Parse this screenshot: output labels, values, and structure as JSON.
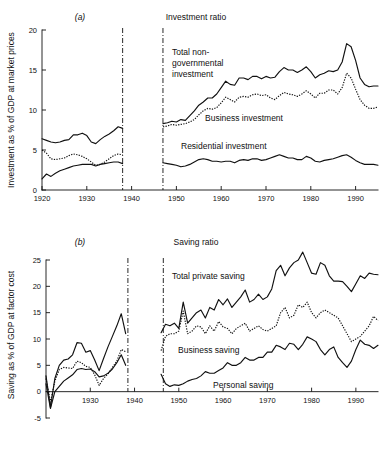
{
  "figure": {
    "background": "#ffffff",
    "ink_color": "#111111"
  },
  "panels": [
    {
      "letter": "(a)",
      "title": "Investment ratio",
      "ylabel": "Investment as % of GDP at market prices"
    },
    {
      "letter": "(b)",
      "title": "Saving ratio",
      "ylabel": "Saving as % of GDP at factor cost"
    }
  ],
  "annotations": {
    "a_total": "Total non-\ngovernmental\ninvestment",
    "a_total_line1": "Total non-",
    "a_total_line2": "governmental",
    "a_total_line3": "investment",
    "a_business": "Business investment",
    "a_residential": "Residential investment",
    "b_total": "Total private saving",
    "b_business": "Business saving",
    "b_personal": "Personal saving"
  },
  "chart_data": [
    {
      "type": "line",
      "id": "investment-ratio",
      "title": "Investment ratio",
      "panel_letter": "(a)",
      "xlabel": "",
      "ylabel": "Investment as % of GDP at market prices",
      "xlim": [
        1920,
        1995
      ],
      "ylim": [
        0,
        20
      ],
      "xticks": [
        1920,
        1930,
        1940,
        1950,
        1960,
        1970,
        1980,
        1990
      ],
      "yticks": [
        0,
        5,
        10,
        15,
        20
      ],
      "grid": false,
      "legend": "inline-annotations",
      "break_lines": [
        1938,
        1947
      ],
      "series": [
        {
          "name": "Total non-governmental investment",
          "style": "solid",
          "x": [
            1920,
            1921,
            1922,
            1923,
            1924,
            1925,
            1926,
            1927,
            1928,
            1929,
            1930,
            1931,
            1932,
            1933,
            1934,
            1935,
            1936,
            1937,
            1938
          ],
          "values": [
            6.4,
            6.2,
            6.0,
            5.9,
            6.0,
            6.2,
            6.3,
            6.9,
            6.9,
            7.1,
            6.8,
            6.0,
            5.8,
            6.3,
            6.7,
            7.0,
            7.4,
            7.9,
            7.7
          ]
        },
        {
          "name": "Total non-governmental investment",
          "style": "solid",
          "x": [
            1947,
            1948,
            1949,
            1950,
            1951,
            1952,
            1953,
            1954,
            1955,
            1956,
            1957,
            1958,
            1959,
            1960,
            1961,
            1962,
            1963,
            1964,
            1965,
            1966,
            1967,
            1968,
            1969,
            1970,
            1971,
            1972,
            1973,
            1974,
            1975,
            1976,
            1977,
            1978,
            1979,
            1980,
            1981,
            1982,
            1983,
            1984,
            1985,
            1986,
            1987,
            1988,
            1989,
            1990,
            1991,
            1992,
            1993,
            1994,
            1995
          ],
          "values": [
            8.3,
            8.4,
            8.6,
            8.5,
            8.8,
            8.7,
            9.3,
            9.9,
            10.6,
            11.0,
            11.5,
            11.5,
            12.0,
            12.8,
            13.6,
            13.2,
            13.1,
            14.0,
            14.0,
            13.8,
            14.2,
            14.2,
            13.9,
            14.2,
            14.0,
            14.1,
            14.8,
            15.3,
            15.0,
            15.0,
            14.7,
            15.0,
            15.4,
            14.8,
            14.0,
            14.4,
            14.6,
            14.9,
            14.8,
            15.0,
            16.0,
            18.3,
            17.9,
            16.2,
            14.0,
            13.2,
            12.9,
            13.0,
            13.0
          ]
        },
        {
          "name": "Business investment",
          "style": "dotted",
          "x": [
            1920,
            1921,
            1922,
            1923,
            1924,
            1925,
            1926,
            1927,
            1928,
            1929,
            1930,
            1931,
            1932,
            1933,
            1934,
            1935,
            1936,
            1937,
            1938
          ],
          "values": [
            5.0,
            4.6,
            3.9,
            3.8,
            3.9,
            4.0,
            4.3,
            4.5,
            4.4,
            4.2,
            3.9,
            3.5,
            3.1,
            3.2,
            3.5,
            3.9,
            4.3,
            4.5,
            4.4
          ]
        },
        {
          "name": "Business investment",
          "style": "dotted",
          "x": [
            1947,
            1948,
            1949,
            1950,
            1951,
            1952,
            1953,
            1954,
            1955,
            1956,
            1957,
            1958,
            1959,
            1960,
            1961,
            1962,
            1963,
            1964,
            1965,
            1966,
            1967,
            1968,
            1969,
            1970,
            1971,
            1972,
            1973,
            1974,
            1975,
            1976,
            1977,
            1978,
            1979,
            1980,
            1981,
            1982,
            1983,
            1984,
            1985,
            1986,
            1987,
            1988,
            1989,
            1990,
            1991,
            1992,
            1993,
            1994,
            1995
          ],
          "values": [
            7.9,
            8.0,
            8.2,
            8.1,
            8.2,
            8.3,
            8.5,
            8.8,
            9.4,
            9.9,
            10.2,
            10.1,
            10.3,
            10.9,
            11.6,
            11.3,
            11.0,
            11.6,
            11.7,
            11.6,
            11.9,
            12.0,
            11.8,
            11.9,
            11.5,
            11.3,
            11.8,
            12.2,
            12.0,
            11.9,
            11.7,
            12.0,
            12.4,
            12.0,
            11.5,
            12.1,
            12.1,
            12.5,
            12.5,
            12.0,
            12.8,
            14.6,
            14.0,
            12.6,
            11.3,
            10.6,
            10.2,
            10.2,
            10.4
          ]
        },
        {
          "name": "Residential investment",
          "style": "solid",
          "x": [
            1920,
            1921,
            1922,
            1923,
            1924,
            1925,
            1926,
            1927,
            1928,
            1929,
            1930,
            1931,
            1932,
            1933,
            1934,
            1935,
            1936,
            1937,
            1938
          ],
          "values": [
            1.4,
            2.0,
            1.7,
            2.1,
            2.4,
            2.6,
            2.8,
            3.0,
            3.1,
            3.2,
            3.2,
            3.2,
            3.0,
            3.2,
            3.3,
            3.4,
            3.5,
            3.5,
            3.3
          ]
        },
        {
          "name": "Residential investment",
          "style": "solid",
          "x": [
            1947,
            1948,
            1949,
            1950,
            1951,
            1952,
            1953,
            1954,
            1955,
            1956,
            1957,
            1958,
            1959,
            1960,
            1961,
            1962,
            1963,
            1964,
            1965,
            1966,
            1967,
            1968,
            1969,
            1970,
            1971,
            1972,
            1973,
            1974,
            1975,
            1976,
            1977,
            1978,
            1979,
            1980,
            1981,
            1982,
            1983,
            1984,
            1985,
            1986,
            1987,
            1988,
            1989,
            1990,
            1991,
            1992,
            1993,
            1994,
            1995
          ],
          "values": [
            3.4,
            3.3,
            3.2,
            3.1,
            2.9,
            3.0,
            3.2,
            3.5,
            3.8,
            3.9,
            3.8,
            3.6,
            3.6,
            3.5,
            3.6,
            3.6,
            3.4,
            3.7,
            3.8,
            3.7,
            3.9,
            3.9,
            3.7,
            3.8,
            4.0,
            4.2,
            4.4,
            4.2,
            4.0,
            4.0,
            3.8,
            3.8,
            4.2,
            4.0,
            3.6,
            3.5,
            3.7,
            3.8,
            3.9,
            4.1,
            4.3,
            4.4,
            4.1,
            3.7,
            3.4,
            3.2,
            3.2,
            3.2,
            3.1
          ]
        }
      ]
    },
    {
      "type": "line",
      "id": "saving-ratio",
      "title": "Saving ratio",
      "panel_letter": "(b)",
      "xlabel": "",
      "ylabel": "Saving as % of GDP at factor cost",
      "xlim": [
        1920,
        1995
      ],
      "ylim": [
        -5,
        25
      ],
      "xticks": [
        1930,
        1940,
        1950,
        1960,
        1970,
        1980,
        1990
      ],
      "yticks": [
        -5,
        0,
        5,
        10,
        15,
        20,
        25
      ],
      "grid": false,
      "legend": "inline-annotations",
      "break_lines": [
        1938.5,
        1946.5
      ],
      "series": [
        {
          "name": "Total private saving",
          "style": "solid",
          "x": [
            1920,
            1921,
            1922,
            1923,
            1924,
            1925,
            1926,
            1927,
            1928,
            1929,
            1930,
            1931,
            1932,
            1933,
            1934,
            1935,
            1936,
            1937,
            1938
          ],
          "values": [
            3.0,
            -3.0,
            2.5,
            5.0,
            6.0,
            6.2,
            7.0,
            9.3,
            9.2,
            7.5,
            7.8,
            6.0,
            4.0,
            6.3,
            8.5,
            10.5,
            12.5,
            14.8,
            11.0
          ]
        },
        {
          "name": "Total private saving",
          "style": "solid",
          "x": [
            1946,
            1947,
            1948,
            1949,
            1950,
            1951,
            1952,
            1953,
            1954,
            1955,
            1956,
            1957,
            1958,
            1959,
            1960,
            1961,
            1962,
            1963,
            1964,
            1965,
            1966,
            1967,
            1968,
            1969,
            1970,
            1971,
            1972,
            1973,
            1974,
            1975,
            1976,
            1977,
            1978,
            1979,
            1980,
            1981,
            1982,
            1983,
            1984,
            1985,
            1986,
            1987,
            1988,
            1989,
            1990,
            1991,
            1992,
            1993,
            1994,
            1995
          ],
          "values": [
            11.2,
            12.8,
            12.5,
            13.0,
            12.0,
            17.0,
            13.0,
            14.0,
            15.0,
            15.5,
            14.0,
            16.0,
            15.5,
            17.5,
            16.5,
            17.6,
            16.0,
            17.0,
            18.0,
            19.3,
            17.0,
            17.5,
            18.5,
            17.5,
            18.0,
            19.5,
            23.0,
            24.0,
            22.0,
            23.5,
            24.5,
            25.0,
            26.5,
            24.5,
            22.5,
            22.3,
            24.5,
            24.0,
            22.0,
            21.0,
            21.0,
            20.9,
            20.0,
            19.0,
            20.5,
            22.0,
            21.5,
            22.5,
            22.3,
            22.2
          ]
        },
        {
          "name": "Business saving",
          "style": "dotted",
          "x": [
            1920,
            1921,
            1922,
            1923,
            1924,
            1925,
            1926,
            1927,
            1928,
            1929,
            1930,
            1931,
            1932,
            1933,
            1934,
            1935,
            1936,
            1937,
            1938
          ],
          "values": [
            2.5,
            -2.0,
            2.0,
            4.2,
            4.6,
            4.5,
            4.4,
            5.8,
            5.5,
            4.8,
            4.6,
            3.2,
            1.2,
            2.5,
            3.4,
            4.6,
            5.8,
            8.0,
            7.6
          ]
        },
        {
          "name": "Business saving",
          "style": "dotted",
          "x": [
            1946,
            1947,
            1948,
            1949,
            1950,
            1951,
            1952,
            1953,
            1954,
            1955,
            1956,
            1957,
            1958,
            1959,
            1960,
            1961,
            1962,
            1963,
            1964,
            1965,
            1966,
            1967,
            1968,
            1969,
            1970,
            1971,
            1972,
            1973,
            1974,
            1975,
            1976,
            1977,
            1978,
            1979,
            1980,
            1981,
            1982,
            1983,
            1984,
            1985,
            1986,
            1987,
            1988,
            1989,
            1990,
            1991,
            1992,
            1993,
            1994,
            1995
          ],
          "values": [
            7.8,
            10.5,
            11.0,
            11.0,
            11.5,
            15.3,
            11.0,
            11.5,
            12.5,
            12.3,
            11.0,
            12.5,
            11.5,
            13.3,
            12.3,
            12.0,
            11.0,
            12.0,
            12.5,
            13.0,
            11.5,
            12.0,
            12.5,
            11.8,
            11.5,
            12.0,
            12.5,
            15.0,
            16.0,
            14.0,
            14.5,
            16.5,
            16.0,
            17.0,
            15.0,
            14.0,
            15.0,
            15.5,
            15.0,
            14.5,
            14.0,
            12.5,
            11.0,
            9.5,
            10.0,
            10.5,
            11.5,
            12.5,
            14.3,
            13.5
          ]
        },
        {
          "name": "Personal saving",
          "style": "solid",
          "x": [
            1920,
            1921,
            1922,
            1923,
            1924,
            1925,
            1926,
            1927,
            1928,
            1929,
            1930,
            1931,
            1932,
            1933,
            1934,
            1935,
            1936,
            1937,
            1938
          ],
          "values": [
            1.5,
            -3.2,
            0.0,
            1.0,
            2.0,
            2.6,
            3.2,
            4.2,
            4.4,
            4.2,
            4.3,
            3.8,
            2.8,
            3.0,
            3.5,
            4.3,
            5.5,
            7.0,
            5.0
          ]
        },
        {
          "name": "Personal saving",
          "style": "solid",
          "x": [
            1946,
            1947,
            1948,
            1949,
            1950,
            1951,
            1952,
            1953,
            1954,
            1955,
            1956,
            1957,
            1958,
            1959,
            1960,
            1961,
            1962,
            1963,
            1964,
            1965,
            1966,
            1967,
            1968,
            1969,
            1970,
            1971,
            1972,
            1973,
            1974,
            1975,
            1976,
            1977,
            1978,
            1979,
            1980,
            1981,
            1982,
            1983,
            1984,
            1985,
            1986,
            1987,
            1988,
            1989,
            1990,
            1991,
            1992,
            1993,
            1994,
            1995
          ],
          "values": [
            3.3,
            1.5,
            1.0,
            1.3,
            1.2,
            1.5,
            2.0,
            2.3,
            2.5,
            3.0,
            3.8,
            3.5,
            3.5,
            4.0,
            4.5,
            5.5,
            5.0,
            5.0,
            5.5,
            6.5,
            6.0,
            6.0,
            6.5,
            6.5,
            7.5,
            7.5,
            8.8,
            8.5,
            8.0,
            9.2,
            9.0,
            8.0,
            9.0,
            10.4,
            10.0,
            9.5,
            8.0,
            7.0,
            8.0,
            8.5,
            6.5,
            5.5,
            4.6,
            5.8,
            8.0,
            9.8,
            9.0,
            8.8,
            8.2,
            8.8
          ]
        }
      ]
    }
  ]
}
